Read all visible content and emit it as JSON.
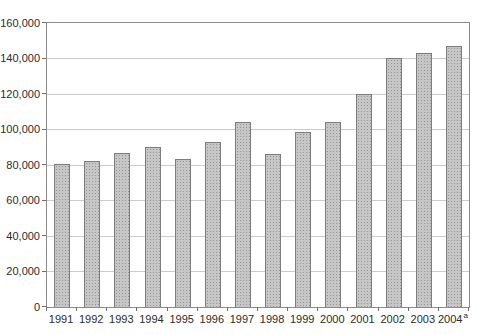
{
  "chart_data": {
    "type": "bar",
    "title": "",
    "xlabel": "",
    "ylabel": "",
    "categories": [
      "1991",
      "1992",
      "1993",
      "1994",
      "1995",
      "1996",
      "1997",
      "1998",
      "1999",
      "2000",
      "2001",
      "2002",
      "2003",
      "2004"
    ],
    "values": [
      80500,
      82000,
      87000,
      90000,
      83500,
      93000,
      104500,
      86000,
      98500,
      104000,
      120000,
      140500,
      143000,
      147000
    ],
    "footnote_marker": "a",
    "ylim": [
      0,
      160000
    ],
    "ytick_step": 20000,
    "ytick_labels": [
      "0",
      "20,000",
      "40,000",
      "60,000",
      "80,000",
      "100,000",
      "120,000",
      "140,000",
      "160,000"
    ],
    "grid": "horizontal",
    "legend": "none",
    "colors": {
      "bar_fill": "#c6c6c6",
      "bar_dot": "#979797",
      "bar_border": "#7d7d7d",
      "gridline": "#cbcbcb",
      "frame": "#8c8c8c",
      "tick": "#6f6f6f",
      "text": "#2b2b2b",
      "background": "#ffffff"
    }
  }
}
